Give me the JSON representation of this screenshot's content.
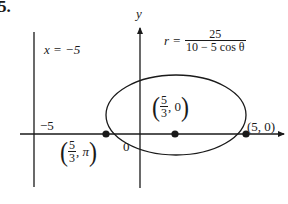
{
  "problem_number": "5.",
  "axes": {
    "x_label": "",
    "y_label": "y",
    "origin_label": "0",
    "x_tick_label": "−5"
  },
  "directrix": {
    "label": "x = −5",
    "x_value": -5
  },
  "equation": {
    "lhs": "r =",
    "numerator": "25",
    "denominator": "10 − 5 cos θ"
  },
  "points": [
    {
      "name": "focus",
      "label_num": "5",
      "label_den": "3",
      "label_rest": ", 0",
      "x": 1.667,
      "y": 0
    },
    {
      "name": "left-vertex",
      "label_num": "5",
      "label_den": "3",
      "label_rest": ", π",
      "x": -1.667,
      "y": 0
    },
    {
      "name": "right-vertex",
      "label": "(5, 0)",
      "x": 5,
      "y": 0
    }
  ],
  "curve": {
    "type": "ellipse",
    "center_x": 1.667,
    "semi_major": 3.333,
    "semi_minor": 2.887
  },
  "colors": {
    "ink": "#1a1a1a",
    "background": "#ffffff"
  }
}
